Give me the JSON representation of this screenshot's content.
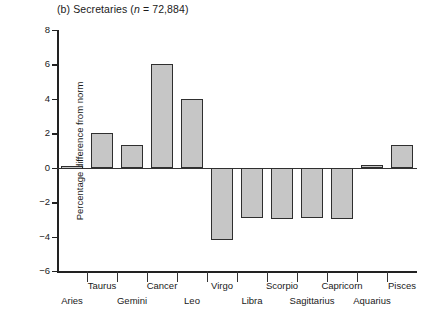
{
  "figure": {
    "panel_label": "(b)",
    "title_plain": "(b) Secretaries (n = 72,884)",
    "title_prefix": "(b) Secretaries (",
    "title_italic": "n",
    "title_suffix": " = 72,884)"
  },
  "chart_data": {
    "type": "bar",
    "title": "(b) Secretaries (n = 72,884)",
    "xlabel": "",
    "ylabel": "Percentage difference from norm",
    "ylim": [
      -6,
      8
    ],
    "yticks": [
      8,
      6,
      4,
      2,
      0,
      -2,
      -4,
      -6
    ],
    "ytick_labels": [
      "8",
      "6",
      "4",
      "2",
      "0",
      "−2",
      "−4",
      "−6"
    ],
    "grid": false,
    "legend": null,
    "sample_size": "72,884",
    "categories": [
      "Aries",
      "Taurus",
      "Gemini",
      "Cancer",
      "Leo",
      "Virgo",
      "Libra",
      "Scorpio",
      "Sagittarius",
      "Capricorn",
      "Aquarius",
      "Pisces"
    ],
    "values": [
      0.1,
      2.0,
      1.3,
      6.0,
      4.0,
      -4.2,
      -2.9,
      -3.0,
      -2.9,
      -3.0,
      0.15,
      1.3
    ],
    "bar_fill_color": "#c6c6c6",
    "bar_edge_color": "#2f2f2f"
  },
  "axis": {
    "y_title": "Percentage difference from norm"
  }
}
